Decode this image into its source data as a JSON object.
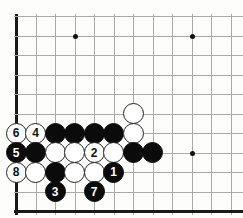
{
  "diagram": {
    "type": "go-board-corner",
    "board_edges": [
      "left",
      "bottom"
    ],
    "grid": {
      "origin_x": 16,
      "origin_y": 16,
      "spacing": 19.5,
      "cols": 12,
      "rows": 10
    },
    "star_points": [
      {
        "col": 3,
        "row": 1
      },
      {
        "col": 9,
        "row": 1
      },
      {
        "col": 9,
        "row": 7
      }
    ],
    "stones": [
      {
        "col": 6,
        "row": 5,
        "color": "white",
        "label": ""
      },
      {
        "col": 0,
        "row": 6,
        "color": "white",
        "label": "6"
      },
      {
        "col": 1,
        "row": 6,
        "color": "white",
        "label": "4"
      },
      {
        "col": 2,
        "row": 6,
        "color": "black",
        "label": ""
      },
      {
        "col": 3,
        "row": 6,
        "color": "black",
        "label": ""
      },
      {
        "col": 4,
        "row": 6,
        "color": "black",
        "label": ""
      },
      {
        "col": 5,
        "row": 6,
        "color": "black",
        "label": ""
      },
      {
        "col": 6,
        "row": 6,
        "color": "white",
        "label": ""
      },
      {
        "col": 0,
        "row": 7,
        "color": "black",
        "label": "5"
      },
      {
        "col": 1,
        "row": 7,
        "color": "black",
        "label": ""
      },
      {
        "col": 2,
        "row": 7,
        "color": "white",
        "label": ""
      },
      {
        "col": 3,
        "row": 7,
        "color": "white",
        "label": ""
      },
      {
        "col": 4,
        "row": 7,
        "color": "white",
        "label": "2"
      },
      {
        "col": 5,
        "row": 7,
        "color": "white",
        "label": ""
      },
      {
        "col": 6,
        "row": 7,
        "color": "black",
        "label": ""
      },
      {
        "col": 7,
        "row": 7,
        "color": "black",
        "label": ""
      },
      {
        "col": 0,
        "row": 8,
        "color": "white",
        "label": "8"
      },
      {
        "col": 1,
        "row": 8,
        "color": "white",
        "label": ""
      },
      {
        "col": 2,
        "row": 8,
        "color": "black",
        "label": ""
      },
      {
        "col": 3,
        "row": 8,
        "color": "white",
        "label": ""
      },
      {
        "col": 4,
        "row": 8,
        "color": "white",
        "label": ""
      },
      {
        "col": 5,
        "row": 8,
        "color": "black",
        "label": "1"
      },
      {
        "col": 2,
        "row": 9,
        "color": "black",
        "label": "3"
      },
      {
        "col": 4,
        "row": 9,
        "color": "black",
        "label": "7"
      }
    ],
    "move_sequence": [
      "1",
      "2",
      "3",
      "4",
      "5",
      "6",
      "7",
      "8"
    ],
    "colors": {
      "board_background": "#fdfdfc",
      "grid_line": "#aaaaa8",
      "edge_line": "#1a1a1a",
      "black_stone": "#0b0b0b",
      "white_stone": "#ffffff",
      "white_stone_border": "#222222"
    }
  }
}
